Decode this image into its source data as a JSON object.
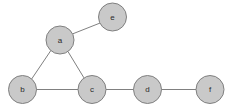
{
  "diagram": {
    "type": "node-link-graph",
    "background_color": "#ffffff",
    "canvas": {
      "width": 232,
      "height": 109
    },
    "style": {
      "node_fill": "#c9c9c9",
      "node_stroke": "#808080",
      "node_stroke_width": 1,
      "node_radius": 14,
      "edge_color": "#808080",
      "edge_width": 1,
      "label_color": "#2b2b2b",
      "label_font_size": 8
    },
    "nodes": [
      {
        "id": "a",
        "label": "a",
        "x": 60,
        "y": 40,
        "r": 14
      },
      {
        "id": "b",
        "label": "b",
        "x": 22.5,
        "y": 89.5,
        "r": 14
      },
      {
        "id": "c",
        "label": "c",
        "x": 92,
        "y": 89.5,
        "r": 14
      },
      {
        "id": "d",
        "label": "d",
        "x": 147.5,
        "y": 89.5,
        "r": 14
      },
      {
        "id": "e",
        "label": "e",
        "x": 112.5,
        "y": 17,
        "r": 14
      },
      {
        "id": "f",
        "label": "f",
        "x": 210,
        "y": 89.5,
        "r": 14
      }
    ],
    "edges": [
      {
        "id": "a-e",
        "source": "a",
        "target": "e",
        "x1": 72.6,
        "y1": 33.9,
        "x2": 99.9,
        "y2": 23.1
      },
      {
        "id": "a-b",
        "source": "a",
        "target": "b",
        "x1": 50.8,
        "y1": 50.6,
        "x2": 31.7,
        "y2": 78.9
      },
      {
        "id": "a-c",
        "source": "a",
        "target": "c",
        "x1": 68.2,
        "y1": 51.9,
        "x2": 83.8,
        "y2": 77.6
      },
      {
        "id": "b-c",
        "source": "b",
        "target": "c",
        "x1": 36.5,
        "y1": 89.5,
        "x2": 78,
        "y2": 89.5
      },
      {
        "id": "c-d",
        "source": "c",
        "target": "d",
        "x1": 106,
        "y1": 89.5,
        "x2": 133.5,
        "y2": 89.5
      },
      {
        "id": "d-f",
        "source": "d",
        "target": "f",
        "x1": 161.5,
        "y1": 89.5,
        "x2": 196,
        "y2": 89.5
      }
    ]
  }
}
